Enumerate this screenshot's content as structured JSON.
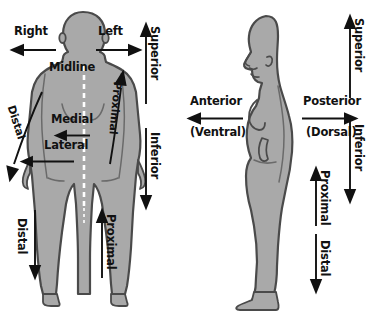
{
  "diagram": {
    "width": 383,
    "height": 312,
    "background_color": "#ffffff",
    "body_fill_color": "#a9a9a9",
    "body_outline_color": "#4a4a4a",
    "arrow_color": "#111111",
    "text_color": "#111111",
    "midline_color": "#ffffff"
  },
  "anterior_view": {
    "view_name": "anterior-view",
    "labels": {
      "right": "Right",
      "left": "Left",
      "midline": "Midline",
      "medial": "Medial",
      "lateral": "Lateral",
      "superior": "Superior",
      "inferior": "Inferior",
      "arm_distal": "Distal",
      "arm_proximal": "Proximal",
      "leg_distal": "Distal",
      "leg_proximal": "Proximal"
    }
  },
  "lateral_view": {
    "view_name": "lateral-view",
    "labels": {
      "anterior": "Anterior",
      "ventral": "(Ventral)",
      "posterior": "Posterior",
      "dorsal": "(Dorsal)",
      "superior": "Superior",
      "inferior": "Inferior",
      "leg_proximal": "Proximal",
      "leg_distal": "Distal"
    }
  },
  "icons": {
    "arrow_left": "arrow-left-icon",
    "arrow_right": "arrow-right-icon",
    "arrow_up": "arrow-up-icon",
    "arrow_down": "arrow-down-icon",
    "midline_dashed": "dashed-midline-icon",
    "human_anterior": "human-body-anterior-icon",
    "human_lateral": "human-body-lateral-icon"
  }
}
